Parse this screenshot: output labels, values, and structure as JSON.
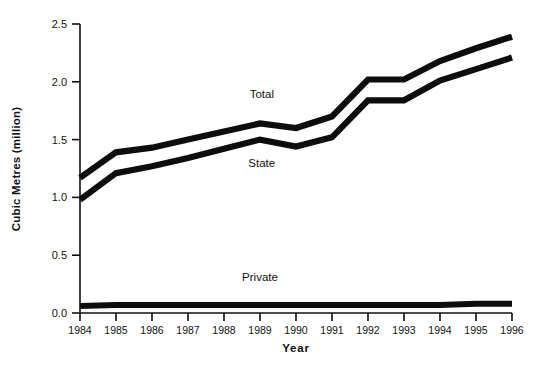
{
  "chart_data": {
    "type": "line",
    "title": "",
    "xlabel": "Year",
    "ylabel": "Cubic Metres (million)",
    "categories": [
      1984,
      1985,
      1986,
      1987,
      1988,
      1989,
      1990,
      1991,
      1992,
      1993,
      1994,
      1995,
      1996
    ],
    "x_tick_labels": [
      "1984",
      "1985",
      "1986",
      "1987",
      "1988",
      "1989",
      "1990",
      "1991",
      "1992",
      "1993",
      "1994",
      "1995",
      "1996"
    ],
    "y_tick_labels": [
      "0.0",
      "0.5",
      "1.0",
      "1.5",
      "2.0",
      "2.5"
    ],
    "y_ticks": [
      0.0,
      0.5,
      1.0,
      1.5,
      2.0,
      2.5
    ],
    "ylim": [
      0.0,
      2.5
    ],
    "xlim": [
      1984,
      1996
    ],
    "grid": false,
    "legend": "inline-annotations",
    "line_color": "#0d0d0d",
    "series": [
      {
        "name": "Total",
        "label": "Total",
        "values": [
          1.17,
          1.39,
          1.43,
          1.5,
          1.57,
          1.64,
          1.6,
          1.7,
          2.02,
          2.02,
          2.18,
          2.29,
          2.39
        ]
      },
      {
        "name": "State",
        "label": "State",
        "values": [
          0.98,
          1.21,
          1.27,
          1.34,
          1.42,
          1.5,
          1.44,
          1.52,
          1.84,
          1.84,
          2.01,
          2.11,
          2.21
        ]
      },
      {
        "name": "Private",
        "label": "Private",
        "values": [
          0.06,
          0.07,
          0.07,
          0.07,
          0.07,
          0.07,
          0.07,
          0.07,
          0.07,
          0.07,
          0.07,
          0.08,
          0.08
        ]
      }
    ],
    "annotations": [
      {
        "text": "Total",
        "x": 1989.05,
        "y": 1.86
      },
      {
        "text": "State",
        "x": 1989.05,
        "y": 1.26
      },
      {
        "text": "Private",
        "x": 1989.0,
        "y": 0.28
      }
    ]
  }
}
